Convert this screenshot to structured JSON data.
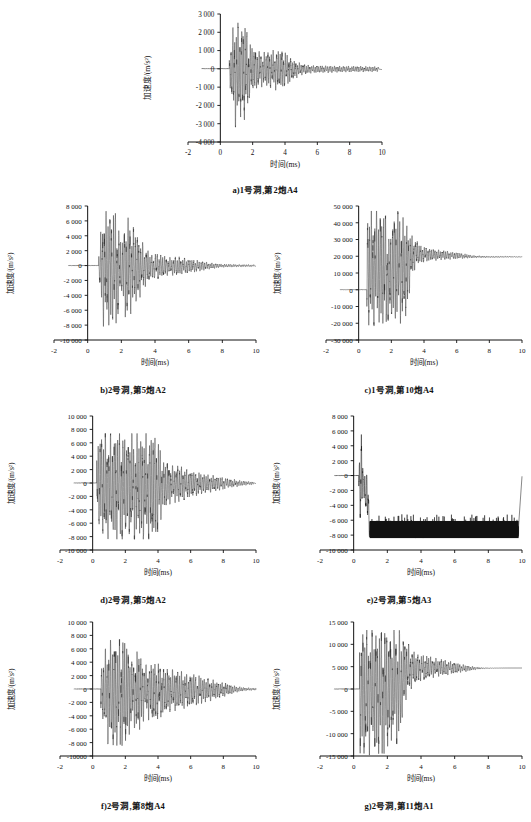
{
  "figure": {
    "axis_titles": {
      "x": "时间(ms)",
      "y": "加速度/(m/s²)"
    },
    "panels": [
      {
        "id": "a",
        "caption": "a)1号洞,第2炮A4",
        "xlabel": "时间(ms)",
        "ylabel": "加速度/(m/s²)",
        "xticks": [
          "-2",
          "0",
          "2",
          "4",
          "6",
          "8",
          "10"
        ],
        "yticks": [
          "3 000",
          "2 000",
          "1 000",
          "0",
          "-1 000",
          "-2 000",
          "-3 000",
          "-4 000"
        ],
        "xlim": [
          -2,
          10
        ],
        "ylim": [
          -4000,
          3000
        ],
        "onset": 0.55,
        "peak_pos": 2700,
        "peak_neg": -3400,
        "decay_end": 9.8,
        "seed": 11
      },
      {
        "id": "b",
        "caption": "b)2号洞,第5炮A2",
        "xlabel": "时间(ms)",
        "ylabel": "加速度/(m/s²)",
        "xticks": [
          "-2",
          "0",
          "2",
          "4",
          "6",
          "8",
          "10"
        ],
        "yticks": [
          "8 000",
          "6 000",
          "4 000",
          "2 000",
          "0",
          "-2 000",
          "-4 000",
          "-6 000",
          "-8 000",
          "-10 000"
        ],
        "xlim": [
          -2,
          10
        ],
        "ylim": [
          -10000,
          8000
        ],
        "onset": 0.65,
        "peak_pos": 7500,
        "peak_neg": -8400,
        "decay_end": 9.9,
        "seed": 23
      },
      {
        "id": "c",
        "caption": "c)1号洞,第10炮A4",
        "xlabel": "时间(ms)",
        "ylabel": "加速度/(m/s²)",
        "xticks": [
          "-2",
          "0",
          "2",
          "4",
          "6",
          "8",
          "10"
        ],
        "yticks": [
          "50 000",
          "40 000",
          "30 000",
          "20 000",
          "10 000",
          "0",
          "-10 000",
          "-20 000",
          "-30 000"
        ],
        "xlim": [
          -2,
          10
        ],
        "ylim": [
          -30000,
          50000
        ],
        "onset": 0.5,
        "peak_pos": 47000,
        "peak_neg": -22000,
        "offset_tail": 19500,
        "decay_end": 10,
        "seed": 37
      },
      {
        "id": "d",
        "caption": "d)2号洞,第5炮A2",
        "xlabel": "时间(ms)",
        "ylabel": "加速度/(m/s²)",
        "xticks": [
          "-2",
          "0",
          "2",
          "4",
          "6",
          "8",
          "10"
        ],
        "yticks": [
          "10 000",
          "8 000",
          "6 000",
          "4 000",
          "2 000",
          "0",
          "-2 000",
          "-4 000",
          "-6 000",
          "-8 000",
          "-10 000"
        ],
        "xlim": [
          -2,
          10
        ],
        "ylim": [
          -10000,
          10000
        ],
        "onset": 0.25,
        "peak_pos": 7400,
        "peak_neg": -8400,
        "decay_end": 9.85,
        "seed": 51
      },
      {
        "id": "e",
        "caption": "e)2号洞,第5炮A3",
        "xlabel": "时间(ms)",
        "ylabel": "加速度/(m/s²)",
        "xticks": [
          "-2",
          "0",
          "2",
          "4",
          "6",
          "8",
          "10"
        ],
        "yticks": [
          "8 000",
          "6 000",
          "4 000",
          "2 000",
          "0",
          "-2 000",
          "-4 000",
          "-6 000",
          "-8 000",
          "-10 000"
        ],
        "xlim": [
          -2,
          10
        ],
        "ylim": [
          -10000,
          8000
        ],
        "onset": 0.3,
        "peak_pos": 7500,
        "peak_neg": -8400,
        "clip_start": 0.95,
        "clip_top": -6100,
        "clip_bottom": -8400,
        "decay_end": 9.8,
        "seed": 67
      },
      {
        "id": "f",
        "caption": "f)2号洞,第8炮A4",
        "xlabel": "时间(ms)",
        "ylabel": "加速度/(m/s²)",
        "xticks": [
          "-2",
          "0",
          "2",
          "4",
          "6",
          "8",
          "10"
        ],
        "yticks": [
          "10 000",
          "8 000",
          "6 000",
          "4 000",
          "2 000",
          "0",
          "-2 000",
          "-4 000",
          "-6 000",
          "-8 000",
          "-10000"
        ],
        "xlim": [
          -2,
          10
        ],
        "ylim": [
          -10000,
          10000
        ],
        "onset": 0.5,
        "peak_pos": 7500,
        "peak_neg": -8500,
        "decay_end": 10,
        "seed": 83
      },
      {
        "id": "g",
        "caption": "g)2号洞,第11炮A1",
        "xlabel": "时间(ms)",
        "ylabel": "加速度/(m/s²)",
        "xticks": [
          "-2",
          "0",
          "2",
          "4",
          "6",
          "8",
          "10"
        ],
        "yticks": [
          "15 000",
          "10 000",
          "5 000",
          "0",
          "-5 000",
          "-10 000",
          "-15 000"
        ],
        "xlim": [
          -2,
          10
        ],
        "ylim": [
          -15000,
          15000
        ],
        "onset": 0.35,
        "peak_pos": 13200,
        "peak_neg": -14800,
        "offset_tail": 4700,
        "decay_end": 10,
        "seed": 97
      }
    ]
  },
  "chart_data": {
    "type": "line",
    "title": "",
    "subtitle": "",
    "shared_xlabel": "时间(ms)",
    "shared_ylabel": "加速度/(m/s²)",
    "grid": false,
    "legend": "none",
    "panel_count": 7,
    "panels": [
      {
        "label": "a",
        "caption": "a)1号洞,第2炮A4",
        "x": [
          -2,
          -1,
          0,
          0.5,
          0.8,
          1.0,
          1.2,
          1.5,
          1.8,
          2.0,
          2.5,
          3.0,
          3.5,
          4.0,
          4.5,
          5.0,
          5.5,
          6.0,
          7.0,
          8.0,
          9.0,
          10
        ],
        "envelope_pos": [
          0,
          0,
          0,
          200,
          2400,
          2700,
          2300,
          2600,
          1400,
          1200,
          900,
          950,
          1100,
          900,
          500,
          300,
          200,
          180,
          160,
          150,
          140,
          120
        ],
        "envelope_neg": [
          0,
          0,
          0,
          -200,
          -2700,
          -3400,
          -2600,
          -2800,
          -1600,
          -1300,
          -1000,
          -1000,
          -1200,
          -1000,
          -600,
          -350,
          -250,
          -220,
          -200,
          -180,
          -170,
          -150
        ],
        "ylim": [
          -4000,
          3000
        ],
        "xlim": [
          -2,
          10
        ],
        "yticks": [
          3000,
          2000,
          1000,
          0,
          -1000,
          -2000,
          -3000,
          -4000
        ],
        "xticks": [
          -2,
          0,
          2,
          4,
          6,
          8,
          10
        ]
      },
      {
        "label": "b",
        "caption": "b)2号洞,第5炮A2",
        "x": [
          -2,
          -1,
          0,
          0.6,
          0.9,
          1.3,
          1.7,
          2.0,
          2.3,
          2.6,
          3.0,
          3.4,
          3.8,
          4.2,
          4.8,
          5.4,
          6.0,
          6.6,
          7.2,
          8.0,
          9.0,
          10
        ],
        "envelope_pos": [
          0,
          0,
          0,
          300,
          7400,
          7200,
          7400,
          3000,
          6900,
          5500,
          4300,
          2500,
          1500,
          1600,
          1100,
          1200,
          900,
          700,
          400,
          200,
          150,
          120
        ],
        "envelope_neg": [
          0,
          0,
          0,
          -300,
          -8200,
          -8000,
          -8100,
          -3500,
          -8300,
          -6200,
          -4800,
          -2900,
          -1800,
          -1800,
          -1300,
          -1400,
          -1000,
          -800,
          -500,
          -250,
          -180,
          -150
        ],
        "ylim": [
          -10000,
          8000
        ],
        "xlim": [
          -2,
          10
        ],
        "yticks": [
          8000,
          6000,
          4000,
          2000,
          0,
          -2000,
          -4000,
          -6000,
          -8000,
          -10000
        ],
        "xticks": [
          -2,
          0,
          2,
          4,
          6,
          8,
          10
        ]
      },
      {
        "label": "c",
        "caption": "c)1号洞,第10炮A4",
        "x": [
          -2,
          -1,
          0,
          0.5,
          0.8,
          1.2,
          1.6,
          1.9,
          2.1,
          2.5,
          2.9,
          3.2,
          3.5,
          3.8,
          4.2,
          4.8,
          5.5,
          6.2,
          7.0,
          8.0,
          9.0,
          10
        ],
        "envelope_pos": [
          0,
          0,
          0,
          47000,
          47000,
          47000,
          47000,
          30000,
          47000,
          47000,
          40000,
          33000,
          30000,
          27000,
          25000,
          24000,
          23000,
          22000,
          20500,
          20000,
          20000,
          19800
        ],
        "envelope_neg": [
          0,
          0,
          0,
          -21000,
          -21500,
          -22000,
          -21500,
          -20000,
          -21000,
          -20500,
          -18000,
          5000,
          14000,
          16000,
          17000,
          17500,
          18000,
          18500,
          19000,
          19200,
          19300,
          19400
        ],
        "offset_tail": 19500,
        "ylim": [
          -30000,
          50000
        ],
        "xlim": [
          -2,
          10
        ],
        "yticks": [
          50000,
          40000,
          30000,
          20000,
          10000,
          0,
          -10000,
          -20000,
          -30000
        ],
        "xticks": [
          -2,
          0,
          2,
          4,
          6,
          8,
          10
        ]
      },
      {
        "label": "d",
        "caption": "d)2号洞,第5炮A2",
        "x": [
          -2,
          -1,
          0,
          0.3,
          0.7,
          1.2,
          1.8,
          2.4,
          3.0,
          3.5,
          3.9,
          4.3,
          4.8,
          5.3,
          5.8,
          6.4,
          7.0,
          7.6,
          8.2,
          9.0,
          9.5,
          10
        ],
        "envelope_pos": [
          0,
          0,
          0,
          7300,
          7400,
          7400,
          7400,
          7400,
          7400,
          7400,
          7400,
          3500,
          2600,
          2600,
          2000,
          1600,
          1300,
          1000,
          700,
          400,
          250,
          200
        ],
        "envelope_neg": [
          0,
          0,
          0,
          -6100,
          -8300,
          -8400,
          -8400,
          -8400,
          -8400,
          -8400,
          -8400,
          -4200,
          -3000,
          -2900,
          -2300,
          -1900,
          -1500,
          -1200,
          -800,
          -500,
          -300,
          -250
        ],
        "ylim": [
          -10000,
          10000
        ],
        "xlim": [
          -2,
          10
        ],
        "yticks": [
          10000,
          8000,
          6000,
          4000,
          2000,
          0,
          -2000,
          -4000,
          -6000,
          -8000,
          -10000
        ],
        "xticks": [
          -2,
          0,
          2,
          4,
          6,
          8,
          10
        ]
      },
      {
        "label": "e",
        "caption": "e)2号洞,第5炮A3",
        "x": [
          -2,
          -1,
          0,
          0.3,
          0.45,
          0.55,
          0.7,
          0.85,
          0.95,
          1.5,
          2.7,
          4.0,
          6.0,
          8.0,
          9.8
        ],
        "envelope_pos": [
          0,
          0,
          0,
          500,
          7500,
          600,
          400,
          200,
          -6100,
          -6100,
          -5300,
          -6100,
          -6100,
          -6100,
          -6100
        ],
        "envelope_neg": [
          0,
          0,
          0,
          -2000,
          -8400,
          -1500,
          -4800,
          -7000,
          -8400,
          -8400,
          -8400,
          -8400,
          -8400,
          -8400,
          -8400
        ],
        "clipped_band": [
          -8400,
          -6100
        ],
        "clip_start": 0.95,
        "ylim": [
          -10000,
          8000
        ],
        "xlim": [
          -2,
          10
        ],
        "yticks": [
          8000,
          6000,
          4000,
          2000,
          0,
          -2000,
          -4000,
          -6000,
          -8000,
          -10000
        ],
        "xticks": [
          -2,
          0,
          2,
          4,
          6,
          8,
          10
        ]
      },
      {
        "label": "f",
        "caption": "f)2号洞,第8炮A4",
        "x": [
          -2,
          -1,
          0,
          0.5,
          0.9,
          1.3,
          1.7,
          2.1,
          2.4,
          2.8,
          3.2,
          3.6,
          4.0,
          4.6,
          5.2,
          5.8,
          6.5,
          7.2,
          8.0,
          8.8,
          9.4,
          10
        ],
        "envelope_pos": [
          0,
          0,
          0,
          3000,
          7200,
          7400,
          7400,
          7400,
          4000,
          6000,
          3500,
          4200,
          3800,
          3000,
          2800,
          2400,
          2000,
          1500,
          1000,
          400,
          200,
          150
        ],
        "envelope_neg": [
          0,
          0,
          0,
          -3500,
          -8200,
          -8400,
          -8500,
          -8400,
          -5000,
          -7000,
          -4200,
          -5000,
          -4500,
          -3500,
          -3200,
          -2800,
          -2300,
          -1800,
          -1200,
          -500,
          -250,
          -200
        ],
        "ylim": [
          -10000,
          10000
        ],
        "xlim": [
          -2,
          10
        ],
        "yticks": [
          10000,
          8000,
          6000,
          4000,
          2000,
          0,
          -2000,
          -4000,
          -6000,
          -8000,
          -10000
        ],
        "xticks": [
          -2,
          0,
          2,
          4,
          6,
          8,
          10
        ]
      },
      {
        "label": "g",
        "caption": "g)2号洞,第11炮A1",
        "x": [
          -2,
          -1,
          0,
          0.35,
          0.7,
          1.1,
          1.5,
          1.9,
          2.3,
          2.7,
          3.0,
          3.4,
          3.8,
          4.3,
          4.8,
          5.4,
          6.0,
          6.8,
          7.6,
          8.4,
          9.2,
          10
        ],
        "envelope_pos": [
          0,
          0,
          0,
          13200,
          13200,
          13200,
          13200,
          13200,
          13200,
          13200,
          12000,
          9000,
          8000,
          7500,
          7000,
          6500,
          6000,
          5200,
          4800,
          4700,
          4700,
          4700
        ],
        "envelope_neg": [
          0,
          0,
          0,
          -14500,
          -14800,
          -14800,
          -14500,
          -14700,
          -11000,
          -13000,
          -4000,
          0,
          1500,
          2200,
          2600,
          3000,
          3400,
          4000,
          4500,
          4650,
          4700,
          4700
        ],
        "offset_tail": 4700,
        "ylim": [
          -15000,
          15000
        ],
        "xlim": [
          -2,
          10
        ],
        "yticks": [
          15000,
          10000,
          5000,
          0,
          -5000,
          -10000,
          -15000
        ],
        "xticks": [
          -2,
          0,
          2,
          4,
          6,
          8,
          10
        ]
      }
    ]
  }
}
